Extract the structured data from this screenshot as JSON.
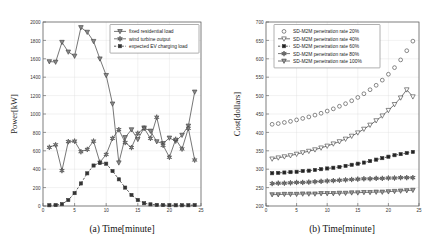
{
  "figure": {
    "panel_count": 2,
    "background": "#ffffff",
    "axis_color": "#555555",
    "grid_color": "#d9d9d9"
  },
  "chart_data": [
    {
      "id": "panel-a",
      "type": "line",
      "title": "",
      "caption": "(a) Time[minute]",
      "xlabel": "(a) Time[minute]",
      "ylabel": "Power[kW]",
      "xlim": [
        0,
        25
      ],
      "ylim": [
        0,
        2000
      ],
      "xticks": [
        0,
        5,
        10,
        15,
        20,
        25
      ],
      "yticks": [
        0,
        200,
        400,
        600,
        800,
        1000,
        1200,
        1400,
        1600,
        1800,
        2000
      ],
      "grid": true,
      "legend_position": "top-right",
      "x": [
        1,
        2,
        3,
        4,
        5,
        6,
        7,
        8,
        9,
        10,
        11,
        12,
        13,
        14,
        15,
        16,
        17,
        18,
        19,
        20,
        21,
        22,
        23,
        24
      ],
      "series": [
        {
          "name": "fixed residential load",
          "marker": "triangle-down",
          "marker_fill": "#8a8a8a",
          "line": "solid",
          "values": [
            1570,
            1565,
            1780,
            1675,
            1630,
            1940,
            1890,
            1790,
            1600,
            1420,
            1110,
            470,
            745,
            830,
            725,
            850,
            815,
            700,
            680,
            740,
            705,
            770,
            870,
            1240
          ]
        },
        {
          "name": "wind turbine output",
          "marker": "star",
          "marker_fill": "#8a8a8a",
          "line": "solid",
          "values": [
            638,
            665,
            385,
            700,
            705,
            590,
            615,
            705,
            475,
            560,
            735,
            830,
            690,
            635,
            790,
            845,
            735,
            965,
            660,
            530,
            725,
            620,
            845,
            500
          ]
        },
        {
          "name": "expected EV charging load",
          "marker": "square",
          "marker_fill": "#333333",
          "line": "dashed",
          "values": [
            8,
            10,
            20,
            65,
            140,
            245,
            355,
            440,
            470,
            460,
            380,
            290,
            200,
            120,
            65,
            30,
            18,
            12,
            10,
            8,
            8,
            8,
            8,
            10
          ]
        }
      ]
    },
    {
      "id": "panel-b",
      "type": "line",
      "title": "",
      "caption": "(b) Time[minute]",
      "xlabel": "(b) Time[minute]",
      "ylabel": "Cost[dollars]",
      "xlim": [
        0,
        25
      ],
      "ylim": [
        200,
        700
      ],
      "xticks": [
        0,
        5,
        10,
        15,
        20,
        25
      ],
      "yticks": [
        200,
        250,
        300,
        350,
        400,
        450,
        500,
        550,
        600,
        650,
        700
      ],
      "grid": true,
      "legend_position": "top-left",
      "x": [
        1,
        2,
        3,
        4,
        5,
        6,
        7,
        8,
        9,
        10,
        11,
        12,
        13,
        14,
        15,
        16,
        17,
        18,
        19,
        20,
        21,
        22,
        23,
        24
      ],
      "series": [
        {
          "name": "SD-M2M penetration rate 20%",
          "marker": "circle-open",
          "marker_fill": "none",
          "line": "none",
          "values": [
            422,
            424,
            427,
            430,
            434,
            438,
            442,
            447,
            452,
            458,
            464,
            471,
            478,
            486,
            495,
            505,
            516,
            528,
            542,
            558,
            576,
            597,
            622,
            648
          ]
        },
        {
          "name": "SD-M2M penetration rate 40%",
          "marker": "triangle-down-open",
          "marker_fill": "none",
          "line": "solid",
          "values": [
            328,
            331,
            334,
            337,
            341,
            345,
            349,
            353,
            358,
            363,
            369,
            375,
            382,
            390,
            399,
            409,
            420,
            432,
            445,
            460,
            476,
            494,
            516,
            497
          ]
        },
        {
          "name": "SD-M2M penetration rate 60%",
          "marker": "square-filled",
          "marker_fill": "#222222",
          "line": "dashed",
          "values": [
            289,
            290,
            291,
            292,
            293,
            295,
            296,
            298,
            300,
            302,
            304,
            306,
            309,
            312,
            315,
            318,
            322,
            326,
            330,
            334,
            338,
            341,
            344,
            347
          ]
        },
        {
          "name": "SD-M2M penetration rate 80%",
          "marker": "star",
          "marker_fill": "#7d7d7d",
          "line": "solid",
          "values": [
            261,
            262,
            262,
            263,
            264,
            264,
            265,
            266,
            267,
            268,
            269,
            270,
            271,
            272,
            273,
            274,
            274,
            275,
            275,
            276,
            276,
            277,
            277,
            277
          ]
        },
        {
          "name": "SD-M2M penetration rate 100%",
          "marker": "triangle-down",
          "marker_fill": "#9a9a9a",
          "line": "solid",
          "values": [
            231,
            231,
            232,
            232,
            232,
            233,
            233,
            233,
            234,
            234,
            234,
            235,
            235,
            236,
            236,
            237,
            237,
            238,
            238,
            239,
            240,
            241,
            242,
            243
          ]
        }
      ]
    }
  ]
}
